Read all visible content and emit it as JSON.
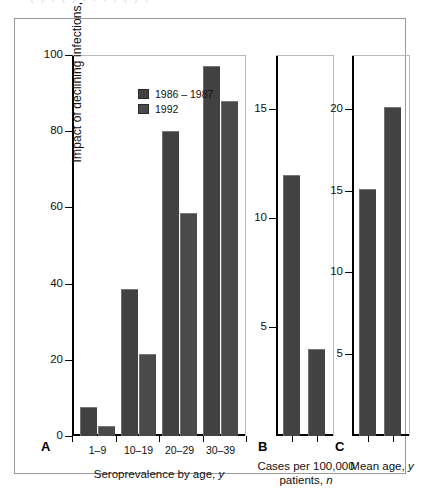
{
  "figure": {
    "background": "#ffffff",
    "frame_color": "#9a9a9a",
    "top_ghost_text": "( ) , ( ) ,  .      . ,  ( ) ,"
  },
  "legend": {
    "items": [
      {
        "label": "1986 – 1987",
        "color": "#414141"
      },
      {
        "label": "1992",
        "color": "#4a4a4a"
      }
    ]
  },
  "panels": {
    "a": {
      "letter": "A",
      "ylabel": "Impact of declining infections, %",
      "xlabel": "Seroprevalence by age, y",
      "xlabel_plain": "Seroprevalence by age, ",
      "xlabel_italic": "y",
      "yticks": [
        "0",
        "20",
        "40",
        "60",
        "80",
        "100"
      ],
      "xticklabels": [
        "1–9",
        "10–19",
        "20–29",
        "30–39"
      ]
    },
    "b": {
      "letter": "B",
      "xlabel_line1": "Cases per 100,000",
      "xlabel_line2_plain": "patients, ",
      "xlabel_line2_italic": "n",
      "yticks": [
        "5",
        "10",
        "15"
      ]
    },
    "c": {
      "letter": "C",
      "xlabel_plain": "Mean age, ",
      "xlabel_italic": "y",
      "yticks": [
        "5",
        "10",
        "15",
        "20"
      ]
    }
  },
  "chart_data": [
    {
      "type": "bar",
      "panel": "A",
      "title": "",
      "xlabel": "Seroprevalence by age, y",
      "ylabel": "Impact of declining infections, %",
      "categories": [
        "1–9",
        "10–19",
        "20–29",
        "30–39"
      ],
      "series": [
        {
          "name": "1986 – 1987",
          "color": "#414141",
          "values": [
            7.5,
            38.5,
            80.0,
            97.0
          ]
        },
        {
          "name": "1992",
          "color": "#4a4a4a",
          "values": [
            2.5,
            21.5,
            58.5,
            88.0
          ]
        }
      ],
      "ylim": [
        0,
        100
      ],
      "yticks": [
        0,
        20,
        40,
        60,
        80,
        100
      ],
      "grid": false,
      "legend_position": "top-left"
    },
    {
      "type": "bar",
      "panel": "B",
      "title": "",
      "xlabel": "Cases per 100,000 patients, n",
      "ylabel": "",
      "categories": [
        "1986 – 1987",
        "1992"
      ],
      "values": [
        12.0,
        4.0
      ],
      "ylim": [
        0,
        17.5
      ],
      "yticks": [
        5,
        10,
        15
      ],
      "grid": false,
      "legend_position": "none"
    },
    {
      "type": "bar",
      "panel": "C",
      "title": "",
      "xlabel": "Mean age, y",
      "ylabel": "",
      "categories": [
        "1986 – 1987",
        "1992"
      ],
      "values": [
        15.1,
        20.1
      ],
      "ylim": [
        0,
        23.3
      ],
      "yticks": [
        5,
        10,
        15,
        20
      ],
      "grid": false,
      "legend_position": "none"
    }
  ]
}
